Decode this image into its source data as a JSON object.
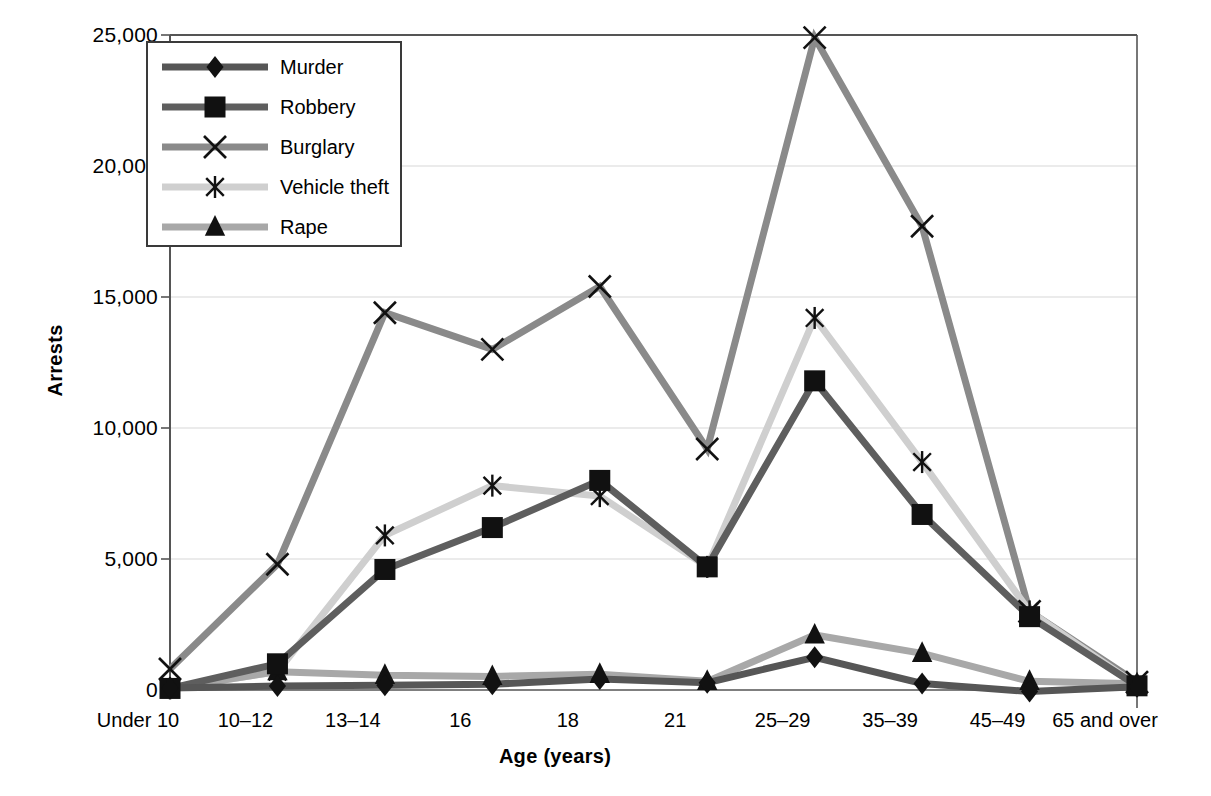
{
  "chart_data": {
    "type": "line",
    "title": "",
    "xlabel": "Age (years)",
    "ylabel": "Arrests",
    "grid": "horizontal",
    "legend_position": "top-left-inside",
    "categories": [
      "Under 10",
      "10–12",
      "13–14",
      "16",
      "18",
      "21",
      "25–29",
      "35–39",
      "45–49",
      "65 and over"
    ],
    "ylim": [
      0,
      25000
    ],
    "yticks": [
      0,
      5000,
      10000,
      15000,
      20000,
      25000
    ],
    "ytick_labels": [
      "0",
      "5,000",
      "10,000",
      "15,000",
      "20,000",
      "25,000"
    ],
    "series": [
      {
        "name": "Murder",
        "marker": "diamond",
        "color": "#565656",
        "values": [
          80,
          150,
          180,
          220,
          420,
          280,
          1250,
          250,
          -60,
          120
        ]
      },
      {
        "name": "Robbery",
        "marker": "square",
        "color": "#5e5e5e",
        "values": [
          60,
          1000,
          4600,
          6200,
          8000,
          4700,
          11800,
          6700,
          2800,
          160
        ]
      },
      {
        "name": "Burglary",
        "marker": "x-cross",
        "color": "#8a8a8a",
        "values": [
          800,
          4800,
          14400,
          13000,
          15400,
          9200,
          24900,
          17700,
          3000,
          300
        ]
      },
      {
        "name": "Vehicle theft",
        "marker": "asterisk",
        "color": "#cfcfcf",
        "values": [
          60,
          700,
          5900,
          7800,
          7400,
          4700,
          14200,
          8700,
          3000,
          180
        ]
      },
      {
        "name": "Rape",
        "marker": "triangle",
        "color": "#a8a8a8",
        "values": [
          70,
          700,
          560,
          520,
          600,
          330,
          2100,
          1400,
          330,
          240
        ]
      }
    ]
  },
  "axes": {
    "ylabel": "Arrests",
    "xlabel": "Age (years)"
  },
  "legend": {
    "entries": [
      {
        "label": "Murder"
      },
      {
        "label": "Robbery"
      },
      {
        "label": "Burglary"
      },
      {
        "label": "Vehicle theft"
      },
      {
        "label": "Rape"
      }
    ]
  },
  "colors": {
    "murder": "#565656",
    "robbery": "#5e5e5e",
    "burglary": "#8a8a8a",
    "vehicle_theft": "#cfcfcf",
    "rape": "#a8a8a8",
    "axis": "#555555",
    "grid": "#d8d8d8",
    "marker": "#111111"
  }
}
